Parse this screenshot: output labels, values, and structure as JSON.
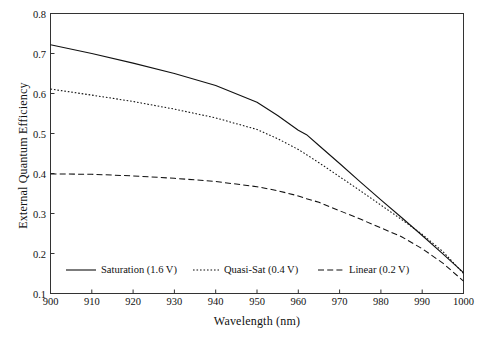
{
  "chart_data": {
    "type": "line",
    "title": "",
    "xlabel": "Wavelength (nm)",
    "ylabel": "External Quantum Efficiency",
    "xlim": [
      900,
      1000
    ],
    "ylim": [
      0.1,
      0.8
    ],
    "xticks": [
      900,
      910,
      920,
      930,
      940,
      950,
      960,
      970,
      980,
      990,
      1000
    ],
    "yticks": [
      0.1,
      0.2,
      0.3,
      0.4,
      0.5,
      0.6,
      0.7,
      0.8
    ],
    "xtick_labels": [
      "900",
      "910",
      "920",
      "930",
      "940",
      "950",
      "960",
      "970",
      "980",
      "990",
      "1000"
    ],
    "ytick_labels": [
      "0.1",
      "0.2",
      "0.3",
      "0.4",
      "0.5",
      "0.6",
      "0.7",
      "0.8"
    ],
    "grid": false,
    "legend_position": "lower-left-inside",
    "line_color": "#111111",
    "x": [
      900,
      910,
      920,
      930,
      940,
      950,
      955,
      960,
      962,
      965,
      970,
      975,
      980,
      985,
      990,
      995,
      1000
    ],
    "series": [
      {
        "name": "Saturation (1.6 V)",
        "label": "Saturation (1.6 V)",
        "style": "solid",
        "values": [
          0.722,
          0.7,
          0.676,
          0.65,
          0.62,
          0.578,
          0.545,
          0.508,
          0.497,
          0.47,
          0.425,
          0.379,
          0.334,
          0.29,
          0.245,
          0.199,
          0.152
        ]
      },
      {
        "name": "Quasi-Sat (0.4 V)",
        "label": "Quasi-Sat (0.4 V)",
        "style": "dotted",
        "values": [
          0.611,
          0.596,
          0.58,
          0.561,
          0.539,
          0.51,
          0.487,
          0.46,
          0.447,
          0.427,
          0.392,
          0.357,
          0.321,
          0.285,
          0.248,
          0.205,
          0.15
        ]
      },
      {
        "name": "Linear (0.2 V)",
        "label": "Linear (0.2 V)",
        "style": "dashed",
        "values": [
          0.399,
          0.398,
          0.394,
          0.388,
          0.38,
          0.367,
          0.357,
          0.344,
          0.337,
          0.328,
          0.307,
          0.286,
          0.264,
          0.242,
          0.212,
          0.176,
          0.131
        ]
      }
    ],
    "legend": [
      {
        "label": "Saturation (1.6 V)",
        "style": "solid"
      },
      {
        "label": "Quasi-Sat (0.4 V)",
        "style": "dotted"
      },
      {
        "label": "Linear (0.2 V)",
        "style": "dashed"
      }
    ]
  }
}
